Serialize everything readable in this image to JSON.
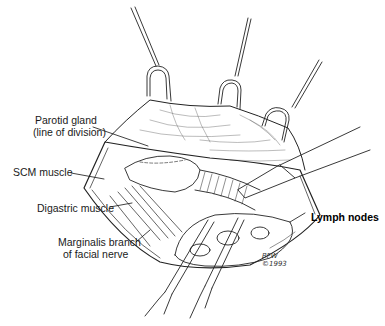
{
  "figure": {
    "type": "surgical illustration",
    "labels": {
      "parotid_line1": "Parotid gland",
      "parotid_line2": "(line of division)",
      "scm": "SCM muscle",
      "digastric": "Digastric muscle",
      "marginalis_line1": "Marginalis branch",
      "marginalis_line2": "of facial nerve",
      "lymph": "Lymph nodes"
    },
    "signature": {
      "initials": "BFW",
      "year": "©1993"
    }
  }
}
